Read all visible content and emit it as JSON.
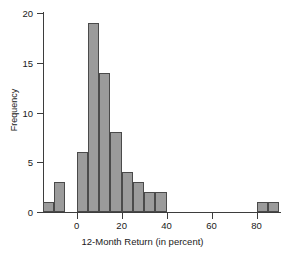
{
  "chart_data": {
    "type": "bar",
    "title": "",
    "xlabel": "12-Month Return (in percent)",
    "ylabel": "Frequency",
    "xlim": [
      -15,
      90
    ],
    "ylim": [
      0,
      20
    ],
    "bin_width": 5,
    "grid": false,
    "legend": null,
    "bar_color": "#9b9b9b",
    "bar_edge_color": "#4a4a4a",
    "axis_color": "#3d3d3d",
    "xticks": [
      0,
      20,
      40,
      60,
      80
    ],
    "xtick_labels": [
      "0",
      "20",
      "40",
      "60",
      "80"
    ],
    "yticks": [
      0,
      5,
      10,
      15,
      20
    ],
    "ytick_labels": [
      "0",
      "5",
      "10",
      "15",
      "20"
    ],
    "bins": [
      {
        "left": -15,
        "right": -10,
        "value": 1
      },
      {
        "left": -10,
        "right": -5,
        "value": 3
      },
      {
        "left": -5,
        "right": 0,
        "value": 0
      },
      {
        "left": 0,
        "right": 5,
        "value": 6
      },
      {
        "left": 5,
        "right": 10,
        "value": 19
      },
      {
        "left": 10,
        "right": 15,
        "value": 14
      },
      {
        "left": 15,
        "right": 20,
        "value": 8
      },
      {
        "left": 20,
        "right": 25,
        "value": 4
      },
      {
        "left": 25,
        "right": 30,
        "value": 3
      },
      {
        "left": 30,
        "right": 35,
        "value": 2
      },
      {
        "left": 35,
        "right": 40,
        "value": 2
      },
      {
        "left": 40,
        "right": 45,
        "value": 0
      },
      {
        "left": 45,
        "right": 50,
        "value": 0
      },
      {
        "left": 50,
        "right": 55,
        "value": 0
      },
      {
        "left": 55,
        "right": 60,
        "value": 0
      },
      {
        "left": 60,
        "right": 65,
        "value": 0
      },
      {
        "left": 65,
        "right": 70,
        "value": 0
      },
      {
        "left": 70,
        "right": 75,
        "value": 0
      },
      {
        "left": 75,
        "right": 80,
        "value": 0
      },
      {
        "left": 80,
        "right": 85,
        "value": 1
      },
      {
        "left": 85,
        "right": 90,
        "value": 1
      }
    ],
    "categories": [
      "-15 to -10",
      "-10 to -5",
      "-5 to 0",
      "0 to 5",
      "5 to 10",
      "10 to 15",
      "15 to 20",
      "20 to 25",
      "25 to 30",
      "30 to 35",
      "35 to 40",
      "40 to 45",
      "45 to 50",
      "50 to 55",
      "55 to 60",
      "60 to 65",
      "65 to 70",
      "70 to 75",
      "75 to 80",
      "80 to 85",
      "85 to 90"
    ],
    "values": [
      1,
      3,
      0,
      6,
      19,
      14,
      8,
      4,
      3,
      2,
      2,
      0,
      0,
      0,
      0,
      0,
      0,
      0,
      0,
      1,
      1
    ]
  }
}
